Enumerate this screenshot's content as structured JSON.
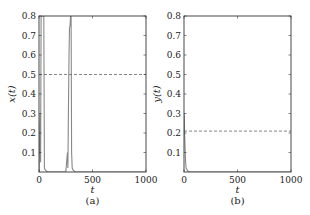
{
  "chart_data": [
    {
      "type": "line",
      "panel": "(a)",
      "xlabel": "t",
      "ylabel": "x(t)",
      "xlim": [
        0,
        1000
      ],
      "ylim": [
        0,
        0.8
      ],
      "xticks": [
        "0",
        "500",
        "1000"
      ],
      "yticks": [
        "0.1",
        "0.2",
        "0.3",
        "0.4",
        "0.5",
        "0.6",
        "0.7",
        "0.8"
      ],
      "grid": false,
      "series": [
        {
          "name": "x(t)",
          "style": "solid",
          "color": "#888888",
          "x": [
            0,
            5,
            10,
            15,
            20,
            25,
            30,
            35,
            40,
            45,
            50,
            60,
            80,
            250,
            265,
            270,
            275,
            280,
            285,
            290,
            295,
            300,
            305,
            310,
            320,
            340,
            1000
          ],
          "y": [
            0.0,
            0.15,
            0.3,
            0.05,
            0.8,
            0.8,
            0.8,
            0.8,
            0.8,
            0.8,
            0.02,
            0.01,
            0.0,
            0.0,
            0.1,
            0.02,
            0.3,
            0.6,
            0.74,
            0.75,
            0.8,
            0.8,
            0.1,
            0.02,
            0.01,
            0.0,
            0.0
          ]
        },
        {
          "name": "reference",
          "style": "dashed",
          "color": "#666666",
          "x": [
            0,
            1000
          ],
          "y": [
            0.5,
            0.5
          ]
        }
      ]
    },
    {
      "type": "line",
      "panel": "(b)",
      "xlabel": "t",
      "ylabel": "y(t)",
      "xlim": [
        0,
        1000
      ],
      "ylim": [
        0,
        0.8
      ],
      "xticks": [
        "0",
        "500",
        "1000"
      ],
      "yticks": [
        "0.1",
        "0.2",
        "0.3",
        "0.4",
        "0.5",
        "0.6",
        "0.7",
        "0.8"
      ],
      "grid": false,
      "series": [
        {
          "name": "y(t)",
          "style": "solid",
          "color": "#888888",
          "x": [
            0,
            3,
            6,
            10,
            15,
            20,
            30,
            50,
            1000
          ],
          "y": [
            0.3,
            0.28,
            0.2,
            0.12,
            0.05,
            0.02,
            0.01,
            0.0,
            0.0
          ]
        },
        {
          "name": "reference",
          "style": "dashed",
          "color": "#666666",
          "x": [
            0,
            1000
          ],
          "y": [
            0.21,
            0.21
          ]
        }
      ]
    }
  ],
  "panels": [
    {
      "caption": "(a)",
      "xlabel": "t",
      "ylabel": "x(t)"
    },
    {
      "caption": "(b)",
      "xlabel": "t",
      "ylabel": "y(t)"
    }
  ]
}
